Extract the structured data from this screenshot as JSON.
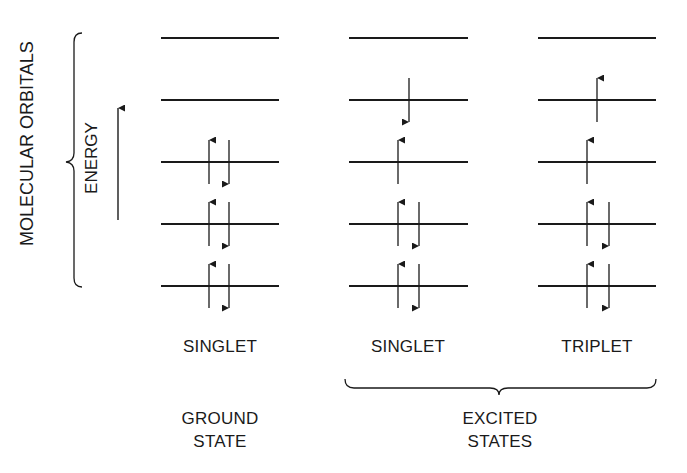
{
  "diagram": {
    "left_label": "MOLECULAR ORBITALS",
    "energy_label": "ENERGY",
    "columns": [
      {
        "state_label": "SINGLET",
        "x": 161,
        "width": 118,
        "up_x": 209,
        "down_x": 229,
        "single_x": 219,
        "orbitals": [
          {
            "level": 5,
            "y": 38,
            "electrons": "empty"
          },
          {
            "level": 4,
            "y": 100,
            "electrons": "empty"
          },
          {
            "level": 3,
            "y": 162,
            "electrons": "paired"
          },
          {
            "level": 2,
            "y": 224,
            "electrons": "paired"
          },
          {
            "level": 1,
            "y": 286,
            "electrons": "paired"
          }
        ]
      },
      {
        "state_label": "SINGLET",
        "x": 349,
        "width": 119,
        "up_x": 398,
        "down_x": 419,
        "single_x": 409,
        "orbitals": [
          {
            "level": 5,
            "y": 38,
            "electrons": "empty"
          },
          {
            "level": 4,
            "y": 100,
            "electrons": "down"
          },
          {
            "level": 3,
            "y": 162,
            "electrons": "up"
          },
          {
            "level": 2,
            "y": 224,
            "electrons": "paired"
          },
          {
            "level": 1,
            "y": 286,
            "electrons": "paired"
          }
        ]
      },
      {
        "state_label": "TRIPLET",
        "x": 538,
        "width": 118,
        "up_x": 587,
        "down_x": 609,
        "single_x": 597,
        "orbitals": [
          {
            "level": 5,
            "y": 38,
            "electrons": "empty"
          },
          {
            "level": 4,
            "y": 100,
            "electrons": "up"
          },
          {
            "level": 3,
            "y": 162,
            "electrons": "up"
          },
          {
            "level": 2,
            "y": 224,
            "electrons": "paired"
          },
          {
            "level": 1,
            "y": 286,
            "electrons": "paired"
          }
        ]
      }
    ],
    "groups": {
      "ground": {
        "line1": "GROUND",
        "line2": "STATE"
      },
      "excited": {
        "line1": "EXCITED",
        "line2": "STATES"
      }
    },
    "colors": {
      "line": "#1a1a1a",
      "background": "#ffffff"
    }
  }
}
